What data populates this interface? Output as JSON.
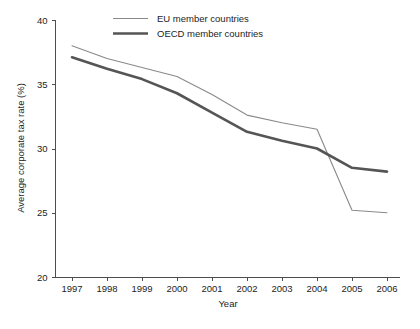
{
  "chart_data": {
    "type": "line",
    "title": "",
    "xlabel": "Year",
    "ylabel": "Average corporate tax rate (%)",
    "x": [
      1997,
      1998,
      1999,
      2000,
      2001,
      2002,
      2003,
      2004,
      2005,
      2006
    ],
    "xtick_labels": [
      "1997",
      "1998",
      "1999",
      "2000",
      "2001",
      "2002",
      "2003",
      "2004",
      "2005",
      "2006"
    ],
    "ytick_labels": [
      "20",
      "25",
      "30",
      "35",
      "40"
    ],
    "yticks": [
      20,
      25,
      30,
      35,
      40
    ],
    "xlim": [
      1997,
      2006
    ],
    "ylim": [
      20,
      40
    ],
    "grid": false,
    "legend_position": "top-center",
    "series": [
      {
        "name": "EU member countries",
        "color": "#8a8a8a",
        "line_width": "thin",
        "values": [
          38.0,
          37.0,
          36.3,
          35.6,
          34.2,
          32.6,
          32.0,
          31.5,
          25.2,
          25.0
        ]
      },
      {
        "name": "OECD member countries",
        "color": "#555555",
        "line_width": "thick",
        "values": [
          37.1,
          36.2,
          35.4,
          34.3,
          32.8,
          31.3,
          30.6,
          30.0,
          28.5,
          28.2
        ]
      }
    ]
  },
  "figure": {
    "legend": [
      {
        "label": "EU member countries",
        "style": "thin-line"
      },
      {
        "label": "OECD member countries",
        "style": "thick-line"
      }
    ]
  }
}
